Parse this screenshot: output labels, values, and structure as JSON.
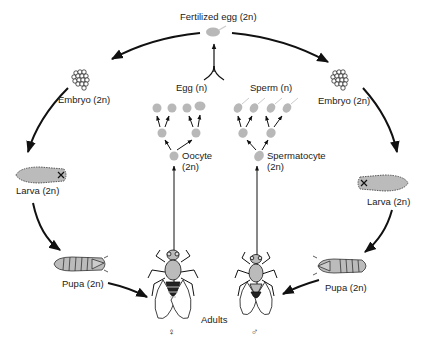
{
  "diagram": {
    "colors": {
      "cell_fill": "#b8b8b8",
      "line": "#111111",
      "text": "#222222",
      "background": "#ffffff"
    },
    "labels": {
      "fertilized_egg": "Fertilized egg (2n)",
      "embryo_left": "Embryo (2n)",
      "embryo_right": "Embryo (2n)",
      "larva_left": "Larva (2n)",
      "larva_right": "Larva (2n)",
      "pupa_left": "Pupa (2n)",
      "pupa_right": "Pupa (2n)",
      "egg": "Egg (n)",
      "sperm": "Sperm (n)",
      "oocyte_line1": "Oocyte",
      "oocyte_line2": "(2n)",
      "spermatocyte_line1": "Spermatocyte",
      "spermatocyte_line2": "(2n)",
      "adults": "Adults",
      "female_symbol": "♀",
      "male_symbol": "♂"
    },
    "nodes": [
      {
        "id": "fertilized-egg",
        "ploidy": "2n"
      },
      {
        "id": "embryo",
        "ploidy": "2n"
      },
      {
        "id": "larva",
        "ploidy": "2n"
      },
      {
        "id": "pupa",
        "ploidy": "2n"
      },
      {
        "id": "adult-female",
        "symbol": "♀"
      },
      {
        "id": "adult-male",
        "symbol": "♂"
      },
      {
        "id": "oocyte",
        "ploidy": "2n"
      },
      {
        "id": "spermatocyte",
        "ploidy": "2n"
      },
      {
        "id": "egg",
        "ploidy": "n"
      },
      {
        "id": "sperm",
        "ploidy": "n"
      }
    ],
    "edges": [
      [
        "fertilized-egg",
        "embryo"
      ],
      [
        "embryo",
        "larva"
      ],
      [
        "larva",
        "pupa"
      ],
      [
        "pupa",
        "adult-female"
      ],
      [
        "pupa",
        "adult-male"
      ],
      [
        "adult-female",
        "oocyte"
      ],
      [
        "adult-male",
        "spermatocyte"
      ],
      [
        "oocyte",
        "egg"
      ],
      [
        "spermatocyte",
        "sperm"
      ],
      [
        "egg",
        "fertilized-egg"
      ],
      [
        "sperm",
        "fertilized-egg"
      ]
    ]
  }
}
